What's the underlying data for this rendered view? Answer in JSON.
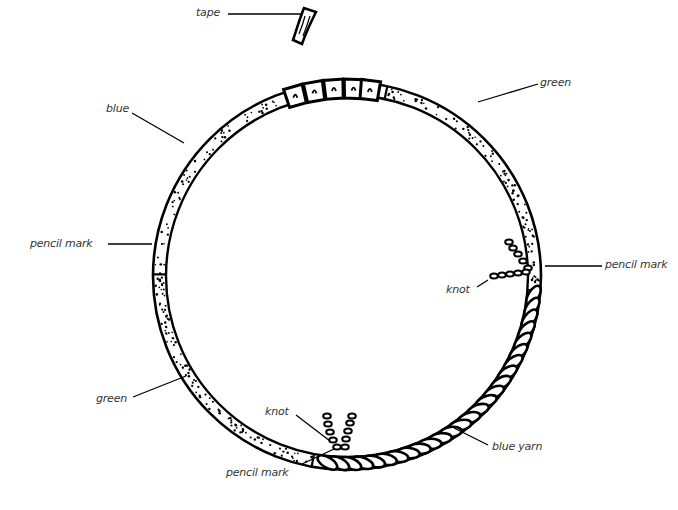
{
  "diagram": {
    "title": "",
    "labels": {
      "tape": "tape",
      "green_top": "green",
      "blue": "blue",
      "pencil_mark_left": "pencil mark",
      "pencil_mark_right": "pencil mark",
      "knot_right": "knot",
      "green_bottom": "green",
      "knot_bottom": "knot",
      "pencil_mark_bottom": "pencil mark",
      "blue_yarn": "blue yarn"
    },
    "colors": {
      "ink": "#000000",
      "label_text": "#333333",
      "background": "#ffffff"
    }
  }
}
